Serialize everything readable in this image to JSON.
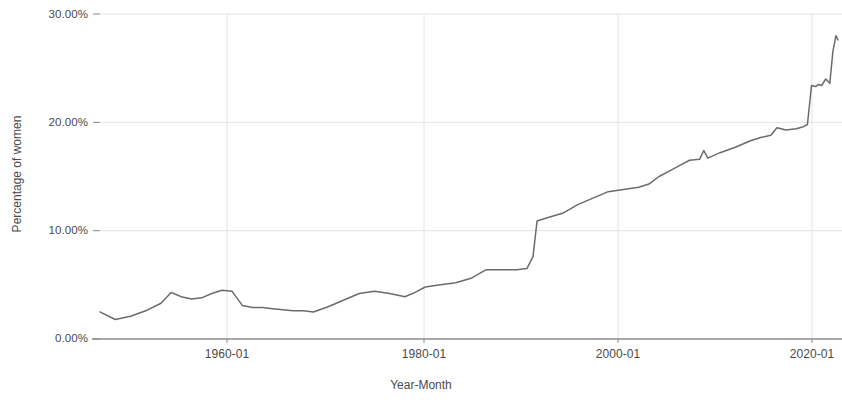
{
  "chart_data": {
    "type": "line",
    "title": "",
    "xlabel": "Year-Month",
    "ylabel": "Percentage of women",
    "ylim": [
      0,
      30
    ],
    "y_tick_labels": [
      "0.00%",
      "10.00%",
      "20.00%",
      "30.00%"
    ],
    "y_tick_values": [
      0,
      10,
      20,
      30
    ],
    "x_tick_labels": [
      "1960-01",
      "1980-01",
      "2000-01",
      "2020-01"
    ],
    "x_tick_values": [
      1960,
      1980,
      2000,
      2020
    ],
    "x_range": [
      1949,
      2022
    ],
    "grid": true,
    "grid_color": "#e4e4e4",
    "legend": "none",
    "series": [
      {
        "name": "Percentage of women",
        "color": "#6b6b6b",
        "x": [
          1949.0,
          1950.5,
          1952.0,
          1953.5,
          1955.0,
          1956.0,
          1957.0,
          1958.0,
          1959.0,
          1960.0,
          1961.0,
          1962.0,
          1963.0,
          1964.0,
          1965.0,
          1966.0,
          1967.0,
          1968.0,
          1969.0,
          1970.0,
          1971.5,
          1973.0,
          1974.5,
          1976.0,
          1977.5,
          1979.0,
          1980.0,
          1981.0,
          1982.5,
          1984.0,
          1985.5,
          1987.0,
          1988.5,
          1990.0,
          1991.0,
          1991.6,
          1992.0,
          1993.0,
          1994.5,
          1996.0,
          1997.5,
          1999.0,
          2000.5,
          2002.0,
          2003.0,
          2004.0,
          2005.0,
          2006.0,
          2007.0,
          2008.0,
          2008.4,
          2008.8,
          2010.0,
          2011.5,
          2013.0,
          2014.0,
          2015.0,
          2015.6,
          2016.5,
          2017.5,
          2018.2,
          2018.6,
          2019.0,
          2019.4,
          2019.7,
          2020.0,
          2020.4,
          2020.8,
          2021.1,
          2021.4,
          2021.6
        ],
        "y": [
          2.5,
          1.8,
          2.1,
          2.6,
          3.3,
          4.3,
          3.9,
          3.7,
          3.8,
          4.2,
          4.5,
          4.4,
          3.1,
          2.9,
          2.9,
          2.8,
          2.7,
          2.6,
          2.6,
          2.5,
          3.0,
          3.6,
          4.2,
          4.4,
          4.2,
          3.9,
          4.3,
          4.8,
          5.0,
          5.2,
          5.6,
          6.4,
          6.4,
          6.4,
          6.5,
          7.6,
          10.9,
          11.2,
          11.6,
          12.4,
          13.0,
          13.6,
          13.8,
          14.0,
          14.3,
          15.0,
          15.5,
          16.0,
          16.5,
          16.6,
          17.4,
          16.7,
          17.2,
          17.7,
          18.3,
          18.6,
          18.8,
          19.5,
          19.3,
          19.4,
          19.6,
          19.8,
          23.4,
          23.3,
          23.5,
          23.4,
          24.0,
          23.6,
          26.5,
          28.0,
          27.6
        ]
      }
    ],
    "annotations": []
  },
  "axes": {
    "y_labels": [
      {
        "text": "30.00%",
        "top": 8
      },
      {
        "text": "20.00%",
        "top": 116
      },
      {
        "text": "10.00%",
        "top": 224
      },
      {
        "text": "0.00%",
        "top": 332
      }
    ],
    "x_labels": [
      {
        "text": "1960-01",
        "left": 227
      },
      {
        "text": "1980-01",
        "left": 424
      },
      {
        "text": "2000-01",
        "left": 618
      },
      {
        "text": "2020-01",
        "left": 812
      }
    ],
    "x_title": "Year-Month",
    "y_title": "Percentage of women"
  }
}
